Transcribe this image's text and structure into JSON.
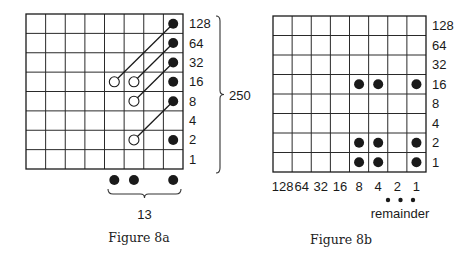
{
  "figures": [
    {
      "id": "fig8a",
      "caption": "Figure 8a",
      "grid": {
        "cols": 8,
        "rows": 8,
        "x0": 26,
        "y0": 14,
        "x1": 183,
        "y1": 169
      },
      "row_labels": [
        "128",
        "64",
        "32",
        "16",
        "8",
        "4",
        "2",
        "1"
      ],
      "filled_dots": [
        {
          "col": 7,
          "row": 0
        },
        {
          "col": 7,
          "row": 1
        },
        {
          "col": 7,
          "row": 2
        },
        {
          "col": 7,
          "row": 3
        },
        {
          "col": 7,
          "row": 4
        },
        {
          "col": 7,
          "row": 6
        }
      ],
      "open_circles": [
        {
          "col": 4,
          "row": 3
        },
        {
          "col": 5,
          "row": 3
        },
        {
          "col": 5,
          "row": 4
        },
        {
          "col": 5,
          "row": 6
        }
      ],
      "connectors": [
        {
          "from": {
            "col": 4,
            "row": 3
          },
          "to": {
            "col": 7,
            "row": 0
          }
        },
        {
          "from": {
            "col": 5,
            "row": 3
          },
          "to": {
            "col": 7,
            "row": 1
          }
        },
        {
          "from": {
            "col": 5,
            "row": 4
          },
          "to": {
            "col": 7,
            "row": 2
          }
        },
        {
          "from": {
            "col": 5,
            "row": 6
          },
          "to": {
            "col": 7,
            "row": 4
          }
        }
      ],
      "below_dots": [
        {
          "col": 4
        },
        {
          "col": 5
        },
        {
          "col": 7
        }
      ],
      "right_brace_label": "250",
      "bottom_brace_label": "13"
    },
    {
      "id": "fig8b",
      "caption": "Figure 8b",
      "grid": {
        "cols": 8,
        "rows": 8,
        "x0": 273,
        "y0": 16,
        "x1": 426,
        "y1": 172
      },
      "row_labels": [
        "128",
        "64",
        "32",
        "16",
        "8",
        "4",
        "2",
        "1"
      ],
      "col_labels": [
        "128",
        "64",
        "32",
        "16",
        "8",
        "4",
        "2",
        "1"
      ],
      "filled_dots": [
        {
          "col": 4,
          "row": 3
        },
        {
          "col": 5,
          "row": 3
        },
        {
          "col": 7,
          "row": 3
        },
        {
          "col": 4,
          "row": 6
        },
        {
          "col": 5,
          "row": 6
        },
        {
          "col": 7,
          "row": 6
        },
        {
          "col": 4,
          "row": 7
        },
        {
          "col": 5,
          "row": 7
        },
        {
          "col": 7,
          "row": 7
        }
      ],
      "remainder_dots": 3,
      "remainder_label": "remainder"
    }
  ],
  "colors": {
    "ink": "#1a1a1a",
    "paper": "#ffffff"
  }
}
